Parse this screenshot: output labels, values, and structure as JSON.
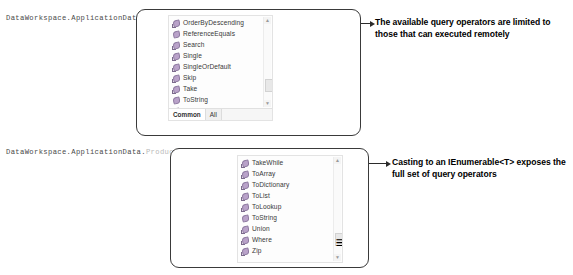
{
  "code_lines": [
    {
      "id": "line1",
      "segments": [
        {
          "text": "DataWorkspace.ApplicationData.Products.",
          "style": "norm"
        }
      ]
    },
    {
      "id": "line2",
      "segments": [
        {
          "text": "DataWorkspace.ApplicationData.",
          "style": "norm"
        },
        {
          "text": "Products.",
          "style": "dim"
        },
        {
          "text": "Cast(",
          "style": "norm"
        },
        {
          "text": "Of Product",
          "style": "dim"
        },
        {
          "text": ").",
          "style": "norm"
        }
      ]
    }
  ],
  "popup_products": {
    "items": [
      {
        "label": "OrderByDescending",
        "icon": "extension-method-icon"
      },
      {
        "label": "ReferenceEquals",
        "icon": "method-icon"
      },
      {
        "label": "Search",
        "icon": "extension-method-icon"
      },
      {
        "label": "Single",
        "icon": "extension-method-icon"
      },
      {
        "label": "SingleOrDefault",
        "icon": "extension-method-icon"
      },
      {
        "label": "Skip",
        "icon": "extension-method-icon"
      },
      {
        "label": "Take",
        "icon": "extension-method-icon"
      },
      {
        "label": "ToString",
        "icon": "method-icon"
      },
      {
        "label": "Where",
        "icon": "extension-method-icon"
      }
    ],
    "tabs": [
      {
        "label": "Common",
        "active": true
      },
      {
        "label": "All",
        "active": false
      }
    ],
    "scrollbar": {
      "up_glyph": "▲",
      "down_glyph": "▼",
      "thumb_glyph": ""
    }
  },
  "popup_cast": {
    "items": [
      {
        "label": "TakeWhile",
        "icon": "extension-method-icon"
      },
      {
        "label": "ToArray",
        "icon": "extension-method-icon"
      },
      {
        "label": "ToDictionary",
        "icon": "extension-method-icon"
      },
      {
        "label": "ToList",
        "icon": "extension-method-icon"
      },
      {
        "label": "ToLookup",
        "icon": "extension-method-icon"
      },
      {
        "label": "ToString",
        "icon": "method-icon"
      },
      {
        "label": "Union",
        "icon": "extension-method-icon"
      },
      {
        "label": "Where",
        "icon": "extension-method-icon"
      },
      {
        "label": "Zip",
        "icon": "extension-method-icon"
      }
    ],
    "scrollbar": {
      "up_glyph": "▲",
      "down_glyph": "▼",
      "thumb_glyph": "≡"
    }
  },
  "annotations": [
    {
      "text": "The available query operators are limited to those that can executed remotely"
    },
    {
      "text": "Casting to an IEnumerable<T> exposes the full set of query operators"
    }
  ],
  "colors": {
    "code_text": "#4a4a4a",
    "code_dim": "#b9b9b9",
    "popup_border": "#3a3a3a",
    "icon_purple": "#b9a2c9",
    "annotation_text": "#000000"
  }
}
